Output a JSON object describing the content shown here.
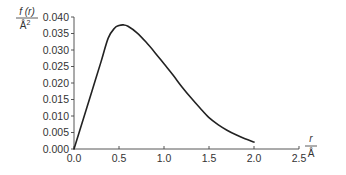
{
  "chart_data": {
    "type": "line",
    "title": "",
    "xlabel": "r / Å",
    "ylabel": "f(r) / Å²",
    "xlabel_numerator": "r",
    "xlabel_denominator": "Å",
    "ylabel_numerator": "f (r)",
    "ylabel_denominator": "Å",
    "ylabel_denominator_sup": "2",
    "xlim": [
      0.0,
      2.5
    ],
    "ylim": [
      0.0,
      0.04
    ],
    "x_ticks": [
      "0.0",
      "0.5",
      "1.0",
      "1.5",
      "2.0",
      "2.5"
    ],
    "y_ticks": [
      "0.000",
      "0.005",
      "0.010",
      "0.015",
      "0.020",
      "0.025",
      "0.030",
      "0.035",
      "0.040"
    ],
    "grid": false,
    "legend": null,
    "series": [
      {
        "name": "f(r)",
        "color": "#222222",
        "x": [
          0.0,
          0.1,
          0.2,
          0.3,
          0.38,
          0.45,
          0.5,
          0.55,
          0.6,
          0.7,
          0.8,
          0.9,
          1.0,
          1.1,
          1.2,
          1.3,
          1.4,
          1.5,
          1.6,
          1.7,
          1.8,
          1.9,
          2.0
        ],
        "y": [
          0.0,
          0.0088,
          0.0176,
          0.0264,
          0.0336,
          0.0366,
          0.0374,
          0.0376,
          0.0372,
          0.0352,
          0.0324,
          0.0292,
          0.0258,
          0.0224,
          0.0188,
          0.0155,
          0.0124,
          0.0095,
          0.0074,
          0.0057,
          0.0043,
          0.0031,
          0.0021
        ]
      }
    ]
  }
}
